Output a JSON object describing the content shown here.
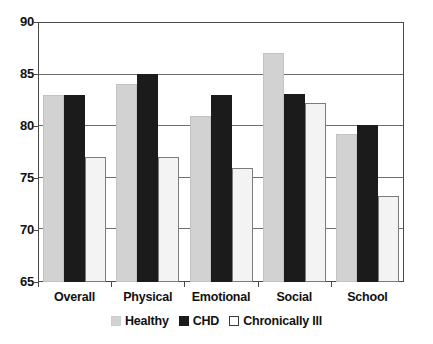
{
  "chart_data": {
    "type": "bar",
    "title": "",
    "xlabel": "",
    "ylabel": "",
    "ylim": [
      65,
      90
    ],
    "yticks": [
      65,
      70,
      75,
      80,
      85,
      90
    ],
    "grid": true,
    "legend_position": "bottom",
    "categories": [
      "Overall",
      "Physical",
      "Emotional",
      "Social",
      "School"
    ],
    "series": [
      {
        "name": "Healthy",
        "color": "#d2d2d2",
        "values": [
          83,
          84,
          81,
          87,
          79.2
        ]
      },
      {
        "name": "CHD",
        "color": "#1b1b1b",
        "values": [
          83,
          85,
          83,
          83.1,
          80.1
        ]
      },
      {
        "name": "Chronically Ill",
        "color": "#f3f3f3",
        "values": [
          77,
          77,
          76,
          82.2,
          73.3
        ]
      }
    ]
  },
  "axis": {
    "y_tick_labels": [
      "90",
      "85",
      "80",
      "75",
      "70",
      "65"
    ],
    "x_tick_labels": [
      "Overall",
      "Physical",
      "Emotional",
      "Social",
      "School"
    ]
  },
  "legend": {
    "items": [
      {
        "label": "Healthy",
        "swatch": "healthy"
      },
      {
        "label": "CHD",
        "swatch": "chd"
      },
      {
        "label": "Chronically Ill",
        "swatch": "ill"
      }
    ]
  }
}
